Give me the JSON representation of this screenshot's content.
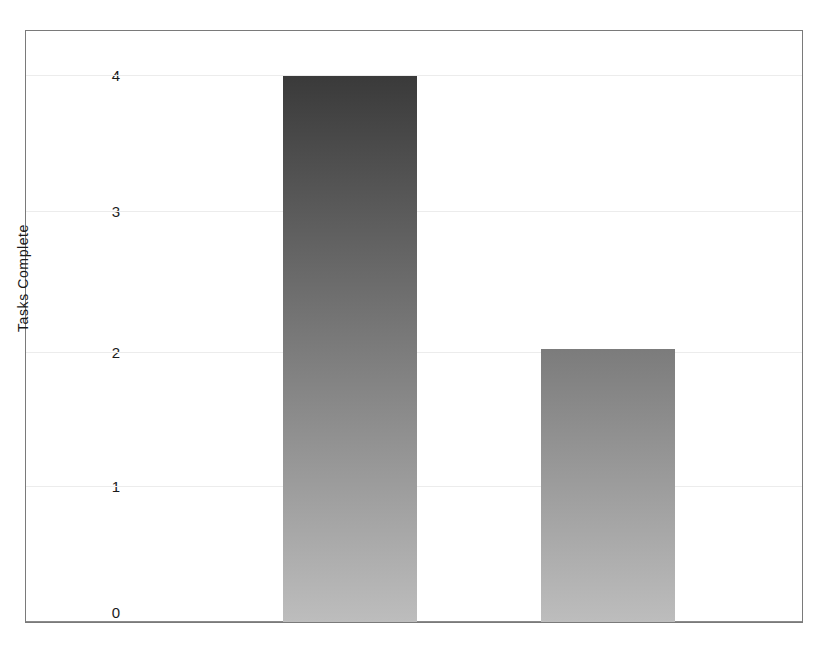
{
  "chart_data": {
    "type": "bar",
    "title": "",
    "xlabel": "",
    "ylabel": "Tasks Complete",
    "categories": [
      "",
      ""
    ],
    "values": [
      4,
      2
    ],
    "ylim": [
      0,
      4
    ],
    "yticks": [
      "0",
      "1",
      "2",
      "3",
      "4"
    ],
    "ytick_values": [
      0,
      1,
      2,
      3,
      4
    ],
    "grid": true,
    "legend": false,
    "bar_color_top": "#3a3a3a",
    "bar_color_bottom": "#bdbdbd",
    "background": "#ffffff",
    "frame_color": "#7a7a7a",
    "gridline_color": "#ececec"
  },
  "axes": {
    "y_axis_title": "Tasks Complete",
    "tick_0": "0",
    "tick_1": "1",
    "tick_2": "2",
    "tick_3": "3",
    "tick_4": "4"
  },
  "bars": [
    {
      "label": "",
      "value": 4,
      "value_text": "4"
    },
    {
      "label": "",
      "value": 2,
      "value_text": "2"
    }
  ]
}
